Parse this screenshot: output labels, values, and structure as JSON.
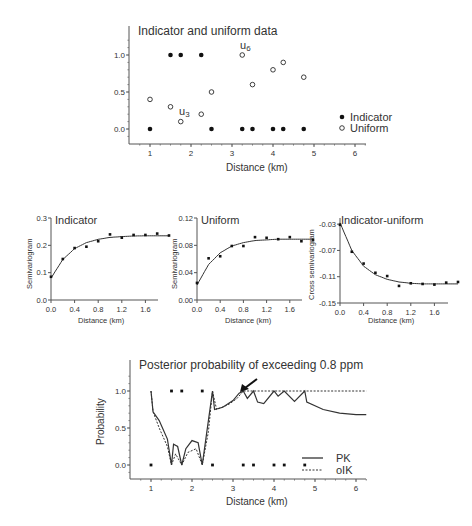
{
  "chart_data": [
    {
      "type": "scatter",
      "title": "Indicator and uniform data",
      "xlabel": "Distance (km)",
      "ylabel": "",
      "xlim": [
        0.5,
        6.5
      ],
      "ylim": [
        -0.2,
        1.3
      ],
      "xticks": [
        "1",
        "2",
        "3",
        "4",
        "5",
        "6"
      ],
      "yticks": [
        "0.0",
        "0.5",
        "1.0"
      ],
      "legend": {
        "position": "right",
        "entries": [
          "Indicator",
          "Uniform"
        ]
      },
      "annotations": [
        {
          "text": "u3",
          "x": 1.75,
          "y": 0.1
        },
        {
          "text": "u6",
          "x": 3.25,
          "y": 1.0
        }
      ],
      "series": [
        {
          "name": "Indicator",
          "marker": "filled-circle",
          "x": [
            1.0,
            1.5,
            1.75,
            2.25,
            2.5,
            3.25,
            3.5,
            4.0,
            4.25,
            4.75
          ],
          "y": [
            0,
            1,
            1,
            1,
            0,
            0,
            0,
            0,
            0,
            0
          ]
        },
        {
          "name": "Uniform",
          "marker": "open-circle",
          "x": [
            1.0,
            1.5,
            1.75,
            2.25,
            2.5,
            3.25,
            3.5,
            4.0,
            4.25,
            4.75
          ],
          "y": [
            0.4,
            0.3,
            0.1,
            0.2,
            0.5,
            1.0,
            0.6,
            0.8,
            0.9,
            0.7
          ]
        }
      ]
    },
    {
      "type": "scatter",
      "title": "Indicator",
      "xlabel": "Distance (km)",
      "ylabel": "Semivariogram",
      "xlim": [
        0,
        2.0
      ],
      "ylim": [
        0,
        0.3
      ],
      "xticks": [
        "0.0",
        "0.4",
        "0.8",
        "1.2",
        "1.6"
      ],
      "yticks": [
        "0.0",
        "0.1",
        "0.2",
        "0.3"
      ],
      "series": [
        {
          "name": "Experimental",
          "x": [
            0.0,
            0.2,
            0.4,
            0.6,
            0.8,
            1.0,
            1.2,
            1.4,
            1.6,
            1.8,
            2.0
          ],
          "y": [
            0.085,
            0.15,
            0.19,
            0.195,
            0.215,
            0.24,
            0.228,
            0.238,
            0.238,
            0.243,
            0.236
          ]
        },
        {
          "name": "Model",
          "line": "solid",
          "x": [
            0.0,
            0.2,
            0.4,
            0.6,
            0.8,
            1.0,
            1.2,
            1.4,
            1.6,
            1.8,
            2.0
          ],
          "y": [
            0.08,
            0.148,
            0.188,
            0.21,
            0.222,
            0.229,
            0.232,
            0.234,
            0.235,
            0.235,
            0.235
          ]
        }
      ]
    },
    {
      "type": "scatter",
      "title": "Uniform",
      "xlabel": "Distance (km)",
      "ylabel": "Semivariogram",
      "xlim": [
        0,
        2.0
      ],
      "ylim": [
        0,
        0.12
      ],
      "xticks": [
        "0.0",
        "0.4",
        "0.8",
        "1.2",
        "1.6"
      ],
      "yticks": [
        "0.00",
        "0.04",
        "0.08",
        "0.12"
      ],
      "series": [
        {
          "name": "Experimental",
          "x": [
            0.0,
            0.2,
            0.4,
            0.6,
            0.8,
            1.0,
            1.2,
            1.4,
            1.6,
            1.8,
            2.0
          ],
          "y": [
            0.025,
            0.061,
            0.064,
            0.079,
            0.079,
            0.092,
            0.091,
            0.089,
            0.092,
            0.086,
            0.088
          ]
        },
        {
          "name": "Model",
          "line": "solid",
          "x": [
            0.0,
            0.2,
            0.4,
            0.6,
            0.8,
            1.0,
            1.2,
            1.4,
            1.6,
            1.8,
            2.0
          ],
          "y": [
            0.022,
            0.052,
            0.069,
            0.079,
            0.084,
            0.087,
            0.088,
            0.089,
            0.089,
            0.089,
            0.089
          ]
        }
      ]
    },
    {
      "type": "scatter",
      "title": "Indicator-uniform",
      "xlabel": "Distance (km)",
      "ylabel": "Cross semivariogram",
      "xlim": [
        0,
        2.0
      ],
      "ylim": [
        -0.15,
        -0.01
      ],
      "xticks": [
        "0.0",
        "0.4",
        "0.8",
        "1.2",
        "1.6"
      ],
      "yticks": [
        "-0.03",
        "-0.07",
        "-0.11",
        "-0.15"
      ],
      "series": [
        {
          "name": "Experimental",
          "x": [
            0.0,
            0.2,
            0.4,
            0.6,
            0.8,
            1.0,
            1.2,
            1.4,
            1.6,
            1.8,
            2.0
          ],
          "y": [
            -0.031,
            -0.072,
            -0.09,
            -0.104,
            -0.109,
            -0.124,
            -0.12,
            -0.121,
            -0.122,
            -0.119,
            -0.118
          ]
        },
        {
          "name": "Model",
          "line": "solid",
          "x": [
            0.0,
            0.2,
            0.4,
            0.6,
            0.8,
            1.0,
            1.2,
            1.4,
            1.6,
            1.8,
            2.0
          ],
          "y": [
            -0.028,
            -0.07,
            -0.094,
            -0.107,
            -0.114,
            -0.118,
            -0.12,
            -0.121,
            -0.121,
            -0.121,
            -0.121
          ]
        }
      ]
    },
    {
      "type": "line",
      "title": "Posterior probability of exceeding 0.8 ppm",
      "xlabel": "Distance (km)",
      "ylabel": "Probability",
      "xlim": [
        0.5,
        6.5
      ],
      "ylim": [
        -0.2,
        1.3
      ],
      "xticks": [
        "1",
        "2",
        "3",
        "4",
        "5",
        "6"
      ],
      "yticks": [
        "0.0",
        "0.5",
        "1.0"
      ],
      "legend": {
        "position": "lower right",
        "entries": [
          "PK",
          "oIK"
        ]
      },
      "annotations": [
        {
          "text": "arrow",
          "x": 3.25,
          "y": 1.0
        }
      ],
      "series": [
        {
          "name": "PK",
          "line": "solid",
          "x": [
            1.0,
            1.05,
            1.2,
            1.4,
            1.5,
            1.55,
            1.65,
            1.75,
            1.85,
            2.0,
            2.15,
            2.25,
            2.35,
            2.5,
            2.55,
            2.75,
            3.0,
            3.15,
            3.25,
            3.35,
            3.5,
            3.6,
            3.75,
            4.0,
            4.1,
            4.25,
            4.5,
            4.75,
            4.8,
            5.2,
            5.6,
            6.0,
            6.25
          ],
          "y": [
            1.0,
            0.72,
            0.6,
            0.35,
            0.0,
            0.28,
            0.25,
            0.0,
            0.22,
            0.33,
            0.3,
            0.0,
            0.4,
            1.0,
            0.75,
            0.78,
            0.87,
            0.97,
            1.0,
            0.9,
            1.0,
            0.85,
            0.83,
            1.0,
            0.93,
            1.0,
            0.86,
            1.0,
            0.85,
            0.75,
            0.7,
            0.68,
            0.68
          ]
        },
        {
          "name": "oIK",
          "line": "dashed",
          "x": [
            1.0,
            1.05,
            1.2,
            1.4,
            1.5,
            1.6,
            1.75,
            1.9,
            2.1,
            2.25,
            2.4,
            2.5,
            2.6,
            2.9,
            3.1,
            3.25,
            3.5,
            4.0,
            4.25,
            4.75,
            5.5,
            6.25
          ],
          "y": [
            1.0,
            0.72,
            0.5,
            0.25,
            0.0,
            0.15,
            0.0,
            0.17,
            0.22,
            0.0,
            0.45,
            1.0,
            0.75,
            0.82,
            0.9,
            1.0,
            1.0,
            1.0,
            1.0,
            1.0,
            1.0,
            1.0
          ]
        }
      ]
    }
  ],
  "labels": {
    "top_title": "Indicator and uniform data",
    "top_xlabel": "Distance (km)",
    "legend_indicator": "Indicator",
    "legend_uniform": "Uniform",
    "u3": "u",
    "u3_sub": "3",
    "u6": "u",
    "u6_sub": "6",
    "ind_title": "Indicator",
    "uni_title": "Uniform",
    "cross_title": "Indicator-uniform",
    "semivariogram": "Semivariogram",
    "cross_semivariogram": "Cross semivariogram",
    "distance_km": "Distance (km)",
    "bottom_title": "Posterior probability of exceeding 0.8 ppm",
    "probability": "Probability",
    "legend_pk": "PK",
    "legend_oik": "oIK"
  }
}
